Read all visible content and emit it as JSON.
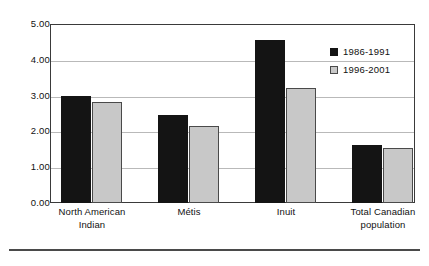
{
  "chart_data": {
    "type": "bar",
    "title": "",
    "xlabel": "",
    "ylabel": "",
    "ylim": [
      0,
      5
    ],
    "ytick_step": 1,
    "grid": true,
    "legend_position": "top-right",
    "categories": [
      "North American Indian",
      "Métis",
      "Inuit",
      "Total Canadian population"
    ],
    "category_lines": [
      [
        "North American",
        "Indian"
      ],
      [
        "Métis"
      ],
      [
        "Inuit"
      ],
      [
        "Total Canadian",
        "population"
      ]
    ],
    "ytick_labels": [
      "5.00",
      "4.00",
      "3.00",
      "2.00",
      "1.00",
      "0.00"
    ],
    "series": [
      {
        "name": "1986-1991",
        "color": "#141414",
        "values": [
          3.0,
          2.46,
          4.55,
          1.62
        ]
      },
      {
        "name": "1996-2001",
        "color": "#c8c8c8",
        "values": [
          2.82,
          2.15,
          3.21,
          1.54
        ]
      }
    ]
  },
  "legend": {
    "entries": [
      {
        "label": "1986-1991"
      },
      {
        "label": "1996-2001"
      }
    ]
  },
  "colors": {
    "series1": "#141414",
    "series2": "#c8c8c8",
    "frame": "#3a3a3a",
    "grid": "#b9b9b9",
    "background": "#ffffff"
  }
}
